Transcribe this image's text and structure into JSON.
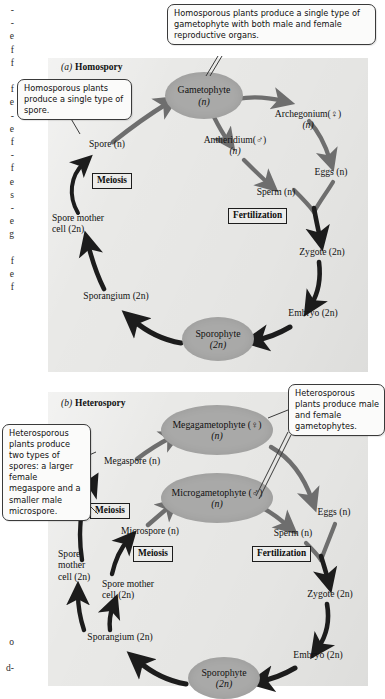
{
  "figure": {
    "margin_text_top": "-\n-\ne\nf\nf\n\nf\ne\n-\ne\nf\n-\nf\ne\ns\n-\ne\ng\n\nf\ne\nf",
    "margin_text_bottom": "o\n\nd-"
  },
  "panel_a": {
    "letter": "(a)",
    "name": "Homospory",
    "callout_top": "Homosporous plants produce a single type of gametophyte with both male and female reproductive organs.",
    "callout_left": "Homosporous plants produce a single type of spore.",
    "bubbles": [
      {
        "name": "gametophyte",
        "line1": "Gametophyte",
        "line2": "(n)"
      },
      {
        "name": "sporophyte",
        "line1": "Sporophyte",
        "line2": "(2n)"
      }
    ],
    "nodes": [
      {
        "name": "spore",
        "text": "Spore (n)"
      },
      {
        "name": "antheridium",
        "text": "Antheridium(♂)",
        "sub": "(n)"
      },
      {
        "name": "archegonium",
        "text": "Archegonium(♀)",
        "sub": "(n)"
      },
      {
        "name": "eggs",
        "text": "Eggs (n)"
      },
      {
        "name": "sperm",
        "text": "Sperm (n)"
      },
      {
        "name": "zygote",
        "text": "Zygote (2n)"
      },
      {
        "name": "embryo",
        "text": "Embryo (2n)"
      },
      {
        "name": "sporangium",
        "text": "Sporangium (2n)"
      },
      {
        "name": "spore-mother-cell",
        "text": "Spore mother",
        "sub": "cell (2n)"
      }
    ],
    "process_meiosis": "Meiosis",
    "process_fertilization": "Fertilization"
  },
  "panel_b": {
    "letter": "(b)",
    "name": "Heterospory",
    "callout_left": "Heterosporous plants produce two types of spores: a larger female megaspore and a smaller male microspore.",
    "callout_right": "Heterosporous plants produce male and female gametophytes.",
    "bubbles": [
      {
        "name": "megagametophyte",
        "line1": "Megagametophyte (♀)",
        "line2": "(n)"
      },
      {
        "name": "microgametophyte",
        "line1": "Microgametophyte (♂)",
        "line2": "(n)"
      },
      {
        "name": "sporophyte",
        "line1": "Sporophyte",
        "line2": "(2n)"
      }
    ],
    "nodes": [
      {
        "name": "megaspore",
        "text": "Megaspore (n)"
      },
      {
        "name": "microspore",
        "text": "Microspore (n)"
      },
      {
        "name": "eggs",
        "text": "Eggs (n)"
      },
      {
        "name": "sperm",
        "text": "Sperm (n)"
      },
      {
        "name": "zygote",
        "text": "Zygote (2n)"
      },
      {
        "name": "embryo",
        "text": "Embryo (2n)"
      },
      {
        "name": "sporangium",
        "text": "Sporangium (2n)"
      },
      {
        "name": "spore-mother-cell-upper",
        "text": "Spore",
        "sub": "mother",
        "sub2": "cell (2n)"
      },
      {
        "name": "spore-mother-cell-lower",
        "text": "Spore mother",
        "sub": "cell (2n)"
      }
    ],
    "process_meiosis_upper": "Meiosis",
    "process_meiosis_lower": "Meiosis",
    "process_fertilization": "Fertilization"
  },
  "colors": {
    "panel_bg": "#e9e9e7",
    "bubble_fill": "#a9a9a8",
    "arrow_dark": "#1c1c1c",
    "arrow_mid": "#6e6e6e",
    "callout_bg": "#fbfbfa",
    "text": "#111111"
  }
}
